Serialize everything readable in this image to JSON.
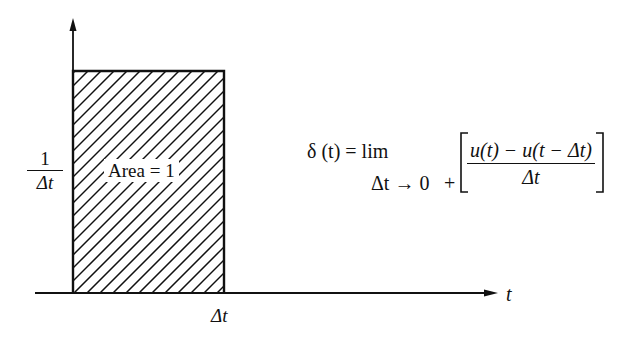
{
  "diagram": {
    "y_axis": {
      "label_numerator": "1",
      "label_denominator": "Δt",
      "direction": "up"
    },
    "x_axis": {
      "label": "t",
      "tick_label": "Δt",
      "direction": "right"
    },
    "pulse": {
      "width": "Δt",
      "height": "1/Δt",
      "fill": "diagonal hatching",
      "area_label": "Area = 1"
    },
    "formula": {
      "lhs": "δ (t) = lim",
      "limit_subscript": "Δt → 0",
      "plus": "+",
      "numerator": "u(t) − u(t − Δt)",
      "denominator": "Δt"
    },
    "colors": {
      "ink": "#111111",
      "background": "#ffffff"
    }
  }
}
